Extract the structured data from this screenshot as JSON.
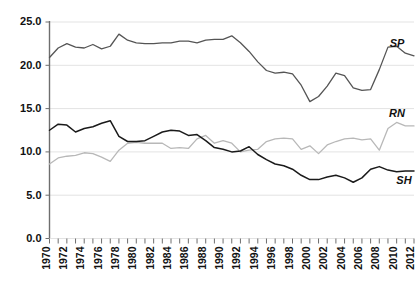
{
  "chart_data": {
    "type": "line",
    "title": "",
    "subtitle": "",
    "xlabel": "",
    "ylabel": "",
    "xlim": [
      1970,
      2012
    ],
    "ylim": [
      0.0,
      25.0
    ],
    "yticks": [
      "0.0",
      "5.0",
      "10.0",
      "15.0",
      "20.0",
      "25.0"
    ],
    "ytick_values": [
      0.0,
      5.0,
      10.0,
      15.0,
      20.0,
      25.0
    ],
    "grid": "horizontal",
    "legend_position": "inline-right-end-of-line",
    "x": [
      1970,
      1971,
      1972,
      1973,
      1974,
      1975,
      1976,
      1977,
      1978,
      1979,
      1980,
      1981,
      1982,
      1983,
      1984,
      1985,
      1986,
      1987,
      1988,
      1989,
      1990,
      1991,
      1992,
      1993,
      1994,
      1995,
      1996,
      1997,
      1998,
      1999,
      2000,
      2001,
      2002,
      2003,
      2004,
      2005,
      2006,
      2007,
      2008,
      2009,
      2010,
      2011,
      2012
    ],
    "xtick_labels": [
      "1970",
      "1972",
      "1974",
      "1976",
      "1978",
      "1980",
      "1982",
      "1984",
      "1986",
      "1988",
      "1990",
      "1992",
      "1994",
      "1996",
      "1998",
      "2000",
      "2002",
      "2004",
      "2006",
      "2008",
      "2010",
      "2012"
    ],
    "series": [
      {
        "name": "SP",
        "label": "SP",
        "color": "#555555",
        "values": [
          20.9,
          22.0,
          22.5,
          22.1,
          22.0,
          22.4,
          21.9,
          22.2,
          23.6,
          22.9,
          22.6,
          22.5,
          22.5,
          22.6,
          22.6,
          22.8,
          22.8,
          22.6,
          22.9,
          23.0,
          23.0,
          23.4,
          22.6,
          21.6,
          20.4,
          19.4,
          19.1,
          19.2,
          19.0,
          17.7,
          15.8,
          16.4,
          17.6,
          19.1,
          18.8,
          17.4,
          17.1,
          17.2,
          19.5,
          22.1,
          22.2,
          21.4,
          21.1
        ]
      },
      {
        "name": "RN",
        "label": "RN",
        "color": "#b8b8b8",
        "values": [
          8.6,
          9.3,
          9.5,
          9.6,
          9.9,
          9.8,
          9.4,
          8.9,
          10.2,
          11.0,
          11.1,
          11.0,
          11.0,
          11.0,
          10.4,
          10.5,
          10.4,
          11.5,
          11.9,
          11.0,
          11.3,
          11.0,
          10.0,
          10.2,
          10.3,
          11.2,
          11.5,
          11.6,
          11.5,
          10.3,
          10.7,
          9.8,
          10.8,
          11.2,
          11.5,
          11.6,
          11.4,
          11.5,
          10.2,
          12.7,
          13.4,
          13.0,
          13.0
        ]
      },
      {
        "name": "SH",
        "label": "SH",
        "color": "#1a1a1a",
        "values": [
          12.5,
          13.2,
          13.1,
          12.3,
          12.7,
          12.9,
          13.3,
          13.6,
          11.8,
          11.2,
          11.2,
          11.3,
          11.8,
          12.3,
          12.5,
          12.4,
          11.9,
          12.0,
          11.3,
          10.5,
          10.3,
          10.0,
          10.1,
          10.6,
          9.7,
          9.1,
          8.6,
          8.4,
          8.0,
          7.3,
          6.8,
          6.8,
          7.1,
          7.3,
          7.0,
          6.5,
          7.0,
          8.0,
          8.3,
          7.9,
          7.7,
          7.8,
          7.8
        ]
      }
    ]
  }
}
